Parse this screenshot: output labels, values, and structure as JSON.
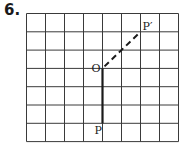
{
  "problem": {
    "number": "6."
  },
  "grid": {
    "origin_x": 26.5,
    "origin_y": 13.5,
    "cell_w": 19,
    "cell_h": 18.3,
    "cols": 8,
    "rows": 7,
    "line_color": "#3a3a3a"
  },
  "points": {
    "O": {
      "label": "O",
      "col": 4,
      "row": 3
    },
    "P": {
      "label": "P",
      "col": 4,
      "row": 6
    },
    "P_prime": {
      "label": "P′",
      "col": 6,
      "row": 1
    }
  },
  "segments": [
    {
      "name": "OP",
      "from": "O",
      "to": "P",
      "style": "solid"
    },
    {
      "name": "OP-prime",
      "from": "O",
      "to": "P_prime",
      "style": "dashed"
    }
  ],
  "colors": {
    "ink": "#1a1a1a"
  }
}
